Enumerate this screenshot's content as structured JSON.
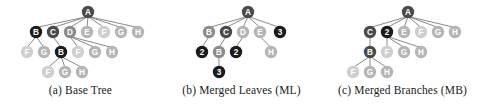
{
  "figure": {
    "background": "#ffffff",
    "node_radius": 6.2,
    "edge_color": "#7d7d7d",
    "palette": {
      "black": "#1b1b1b",
      "dark": "#4a4a4a",
      "mid": "#8c8c8c",
      "light": "#b5b5b5",
      "pale": "#cfcfcf",
      "label_on_dark": "#ffffff",
      "label_on_light": "#ffffff"
    }
  },
  "panels": [
    {
      "id": "base-tree",
      "caption": "(a) Base Tree",
      "left": 0,
      "width": 161,
      "nodes": [
        {
          "id": "a",
          "label": "A",
          "x": 88,
          "y": 12,
          "tone": "dark"
        },
        {
          "id": "b1",
          "label": "B",
          "x": 36,
          "y": 32,
          "tone": "black"
        },
        {
          "id": "c1",
          "label": "C",
          "x": 53,
          "y": 32,
          "tone": "dark"
        },
        {
          "id": "d1",
          "label": "D",
          "x": 70,
          "y": 32,
          "tone": "mid"
        },
        {
          "id": "e1",
          "label": "E",
          "x": 87,
          "y": 32,
          "tone": "light"
        },
        {
          "id": "f1",
          "label": "F",
          "x": 104,
          "y": 32,
          "tone": "pale"
        },
        {
          "id": "g1",
          "label": "G",
          "x": 121,
          "y": 32,
          "tone": "light"
        },
        {
          "id": "h1",
          "label": "H",
          "x": 138,
          "y": 32,
          "tone": "light"
        },
        {
          "id": "f2",
          "label": "F",
          "x": 27,
          "y": 52,
          "tone": "pale"
        },
        {
          "id": "g2",
          "label": "G",
          "x": 44,
          "y": 52,
          "tone": "light"
        },
        {
          "id": "b2",
          "label": "B",
          "x": 61,
          "y": 52,
          "tone": "black"
        },
        {
          "id": "f3",
          "label": "F",
          "x": 78,
          "y": 52,
          "tone": "pale"
        },
        {
          "id": "g3",
          "label": "G",
          "x": 95,
          "y": 52,
          "tone": "light"
        },
        {
          "id": "h2",
          "label": "H",
          "x": 112,
          "y": 52,
          "tone": "light"
        },
        {
          "id": "f4",
          "label": "F",
          "x": 48,
          "y": 72,
          "tone": "pale"
        },
        {
          "id": "g4",
          "label": "G",
          "x": 65,
          "y": 72,
          "tone": "light"
        },
        {
          "id": "h3",
          "label": "H",
          "x": 82,
          "y": 72,
          "tone": "light"
        }
      ],
      "edges": [
        [
          "a",
          "b1"
        ],
        [
          "a",
          "c1"
        ],
        [
          "a",
          "d1"
        ],
        [
          "a",
          "e1"
        ],
        [
          "a",
          "f1"
        ],
        [
          "a",
          "g1"
        ],
        [
          "a",
          "h1"
        ],
        [
          "b1",
          "f2"
        ],
        [
          "b1",
          "g2"
        ],
        [
          "c1",
          "b2"
        ],
        [
          "d1",
          "f3"
        ],
        [
          "d1",
          "g3"
        ],
        [
          "d1",
          "h2"
        ],
        [
          "b2",
          "f4"
        ],
        [
          "b2",
          "g4"
        ],
        [
          "b2",
          "h3"
        ]
      ]
    },
    {
      "id": "merged-leaves",
      "caption": "(b) Merged Leaves (ML)",
      "left": 161,
      "width": 161,
      "nodes": [
        {
          "id": "a",
          "label": "A",
          "x": 87,
          "y": 12,
          "tone": "dark"
        },
        {
          "id": "b1",
          "label": "B",
          "x": 48,
          "y": 32,
          "tone": "mid"
        },
        {
          "id": "c1",
          "label": "C",
          "x": 65,
          "y": 32,
          "tone": "dark"
        },
        {
          "id": "d1",
          "label": "D",
          "x": 82,
          "y": 32,
          "tone": "light"
        },
        {
          "id": "e1",
          "label": "E",
          "x": 99,
          "y": 32,
          "tone": "light"
        },
        {
          "id": "n3a",
          "label": "3",
          "x": 119,
          "y": 32,
          "tone": "black"
        },
        {
          "id": "n2a",
          "label": "2",
          "x": 41,
          "y": 52,
          "tone": "black"
        },
        {
          "id": "b2",
          "label": "B",
          "x": 58,
          "y": 52,
          "tone": "mid"
        },
        {
          "id": "n2b",
          "label": "2",
          "x": 75,
          "y": 52,
          "tone": "black"
        },
        {
          "id": "h1",
          "label": "H",
          "x": 110,
          "y": 52,
          "tone": "light"
        },
        {
          "id": "n3b",
          "label": "3",
          "x": 58,
          "y": 72,
          "tone": "black"
        }
      ],
      "edges": [
        [
          "a",
          "b1"
        ],
        [
          "a",
          "c1"
        ],
        [
          "a",
          "d1"
        ],
        [
          "a",
          "e1"
        ],
        [
          "a",
          "n3a"
        ],
        [
          "b1",
          "n2a"
        ],
        [
          "c1",
          "b2"
        ],
        [
          "d1",
          "n2b"
        ],
        [
          "e1",
          "h1"
        ],
        [
          "b2",
          "n3b"
        ]
      ]
    },
    {
      "id": "merged-branches",
      "caption": "(c) Merged Branches (MB)",
      "left": 322,
      "width": 161,
      "nodes": [
        {
          "id": "a",
          "label": "A",
          "x": 86,
          "y": 12,
          "tone": "dark"
        },
        {
          "id": "c1",
          "label": "C",
          "x": 48,
          "y": 32,
          "tone": "dark"
        },
        {
          "id": "n2",
          "label": "2",
          "x": 65,
          "y": 32,
          "tone": "black"
        },
        {
          "id": "e1",
          "label": "E",
          "x": 82,
          "y": 32,
          "tone": "light"
        },
        {
          "id": "f1",
          "label": "F",
          "x": 99,
          "y": 32,
          "tone": "pale"
        },
        {
          "id": "g1",
          "label": "G",
          "x": 116,
          "y": 32,
          "tone": "light"
        },
        {
          "id": "h1",
          "label": "H",
          "x": 133,
          "y": 32,
          "tone": "light"
        },
        {
          "id": "b1",
          "label": "B",
          "x": 48,
          "y": 52,
          "tone": "dark"
        },
        {
          "id": "f2",
          "label": "F",
          "x": 65,
          "y": 52,
          "tone": "pale"
        },
        {
          "id": "g2",
          "label": "G",
          "x": 82,
          "y": 52,
          "tone": "light"
        },
        {
          "id": "h2",
          "label": "H",
          "x": 99,
          "y": 52,
          "tone": "light"
        },
        {
          "id": "f3",
          "label": "F",
          "x": 31,
          "y": 72,
          "tone": "pale"
        },
        {
          "id": "g3",
          "label": "G",
          "x": 48,
          "y": 72,
          "tone": "light"
        },
        {
          "id": "h3",
          "label": "H",
          "x": 65,
          "y": 72,
          "tone": "light"
        }
      ],
      "edges": [
        [
          "a",
          "c1"
        ],
        [
          "a",
          "n2"
        ],
        [
          "a",
          "e1"
        ],
        [
          "a",
          "f1"
        ],
        [
          "a",
          "g1"
        ],
        [
          "a",
          "h1"
        ],
        [
          "c1",
          "b1"
        ],
        [
          "n2",
          "f2"
        ],
        [
          "n2",
          "g2"
        ],
        [
          "n2",
          "h2"
        ],
        [
          "b1",
          "f3"
        ],
        [
          "b1",
          "g3"
        ],
        [
          "b1",
          "h3"
        ]
      ]
    }
  ]
}
